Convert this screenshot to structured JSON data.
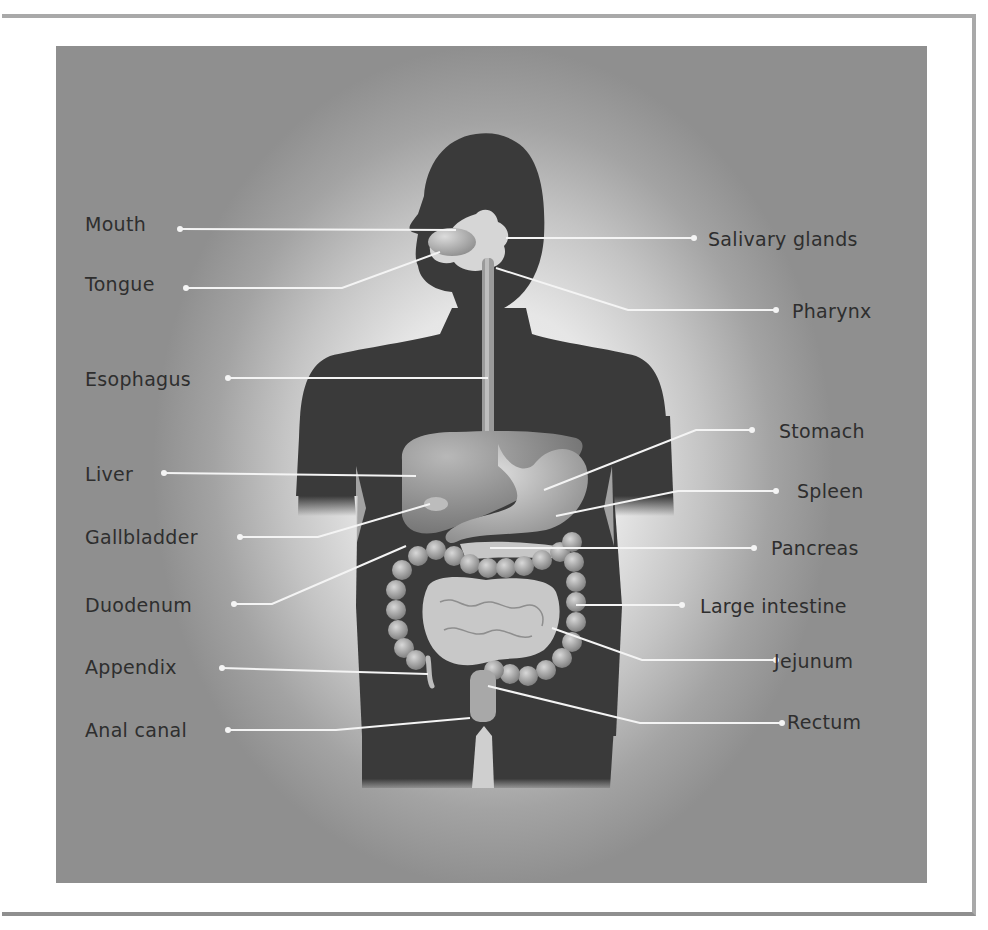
{
  "diagram": {
    "colors": {
      "silhouette": "#3a3a3a",
      "background_center": "#f2f2f2",
      "background_edge": "#8f8f8f",
      "leader_line": "#f4f4f4",
      "label_text": "#2e2e2e"
    },
    "labels_left": [
      {
        "id": "mouth",
        "text": "Mouth"
      },
      {
        "id": "tongue",
        "text": "Tongue"
      },
      {
        "id": "esophagus",
        "text": "Esophagus"
      },
      {
        "id": "liver",
        "text": "Liver"
      },
      {
        "id": "gallbladder",
        "text": "Gallbladder"
      },
      {
        "id": "duodenum",
        "text": "Duodenum"
      },
      {
        "id": "appendix",
        "text": "Appendix"
      },
      {
        "id": "anal-canal",
        "text": "Anal canal"
      }
    ],
    "labels_right": [
      {
        "id": "salivary-glands",
        "text": "Salivary glands"
      },
      {
        "id": "pharynx",
        "text": "Pharynx"
      },
      {
        "id": "stomach",
        "text": "Stomach"
      },
      {
        "id": "spleen",
        "text": "Spleen"
      },
      {
        "id": "pancreas",
        "text": "Pancreas"
      },
      {
        "id": "large-intestine",
        "text": "Large intestine"
      },
      {
        "id": "jejunum",
        "text": "Jejunum"
      },
      {
        "id": "rectum",
        "text": "Rectum"
      }
    ]
  }
}
